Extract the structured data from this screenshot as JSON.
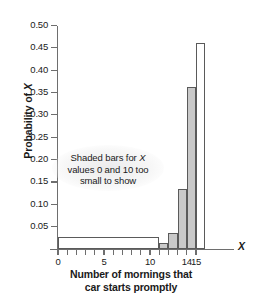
{
  "chart_data": {
    "type": "bar",
    "title": "",
    "xlabel": "Number of mornings that car starts promptly",
    "xlabel_line1": "Number of mornings that",
    "xlabel_line2": "car starts promptly",
    "ylabel": "Probability of X",
    "ylabel_prefix": "Probability of ",
    "ylabel_variable": "X",
    "x_axis_symbol": "X",
    "xlim": [
      -0.9,
      16.0
    ],
    "ylim": [
      0,
      0.5
    ],
    "grid": false,
    "legend": "none",
    "categories": [
      0,
      1,
      2,
      3,
      4,
      5,
      6,
      7,
      8,
      9,
      10,
      11,
      12,
      13,
      14,
      15
    ],
    "values": [
      0.0,
      0.0,
      0.0,
      0.0,
      0.0,
      0.0,
      0.0,
      0.0,
      0.0,
      0.0,
      0.0,
      0.014,
      0.036,
      0.135,
      0.363,
      0.46
    ],
    "bar_styles": [
      "hollow",
      "hollow",
      "hollow",
      "hollow",
      "hollow",
      "hollow",
      "hollow",
      "hollow",
      "hollow",
      "hollow",
      "hollow",
      "filled",
      "filled",
      "filled",
      "filled",
      "hollow"
    ],
    "ytick_labels": [
      "0.50",
      "0.45",
      "0.40",
      "0.35",
      "0.30",
      "0.25",
      "0.20",
      "0.15",
      "0.10",
      "0.05"
    ],
    "ytick_values": [
      0.5,
      0.45,
      0.4,
      0.35,
      0.3,
      0.25,
      0.2,
      0.15,
      0.1,
      0.05
    ],
    "xtick_values": [
      0,
      1,
      2,
      3,
      4,
      5,
      6,
      7,
      8,
      9,
      10,
      11,
      12,
      13,
      14,
      15
    ],
    "xtick_labels": [
      "0",
      "",
      "",
      "",
      "",
      "5",
      "",
      "",
      "",
      "",
      "10",
      "",
      "",
      "",
      "14",
      "15"
    ],
    "annotation": {
      "line1_prefix": "Shaded bars for ",
      "line1_variable": "X",
      "line2": "values 0 and 10 too",
      "line3": "small to show",
      "full_text": "Shaded bars for X values 0 and 10 too small to show"
    },
    "colors": {
      "bar_fill": "#c9c9c9",
      "bar_edge": "#5a5a5a",
      "axis": "#6e6e6e",
      "text": "#1a1a1a",
      "background": "#ffffff"
    }
  }
}
